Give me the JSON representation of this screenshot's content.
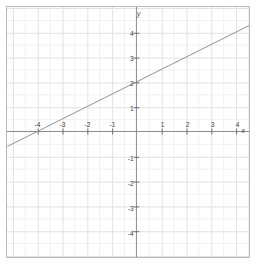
{
  "chart_data": {
    "type": "line",
    "title": "",
    "xlabel": "x",
    "ylabel": "y",
    "xlim": [
      -5.2,
      4.56
    ],
    "ylim": [
      -4.92,
      4.96
    ],
    "grid": true,
    "minor_grid": true,
    "minor_step": 0.5,
    "major_step": 1,
    "legend": "none",
    "series": [
      {
        "name": "line",
        "equation": "y = 0.5x + 2",
        "slope": 0.5,
        "intercept": 2,
        "x_intercept": -4,
        "x": [
          -5.2,
          4.56
        ],
        "y": [
          -0.6,
          4.28
        ],
        "color": "#8f8f95"
      }
    ],
    "x_ticks": [
      -4,
      -3,
      -2,
      -1,
      1,
      2,
      3,
      4
    ],
    "y_ticks": [
      4,
      3,
      2,
      1,
      -1,
      -2,
      -3,
      -4
    ],
    "x_tick_labels": [
      "-4",
      "-3",
      "-2",
      "-1",
      "1",
      "2",
      "3",
      "4"
    ],
    "y_tick_labels": [
      "4",
      "3",
      "2",
      "1",
      "-1",
      "-2",
      "-3",
      "-4"
    ]
  },
  "axes": {
    "x_axis_name": "x",
    "y_axis_name": "y",
    "origin_label": ""
  },
  "colors": {
    "frame": "#b9b9bc",
    "axis": "#8a8a8f",
    "major_grid": "#e2e2e6",
    "minor_grid": "#f1f1f4",
    "line": "#8f8f95",
    "text": "#3b3b3f",
    "background": "#ffffff"
  }
}
